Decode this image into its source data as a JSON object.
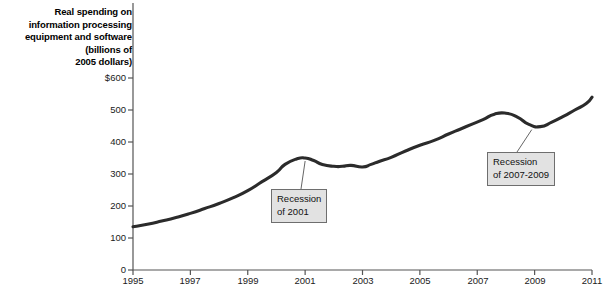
{
  "chart_data": {
    "type": "line",
    "title": "Real spending on information processing equipment and software (billions of 2005 dollars)",
    "title_lines": [
      "Real spending on",
      "information processing",
      "equipment and software",
      "(billions of",
      "2005 dollars)"
    ],
    "xlabel": "",
    "ylabel": "",
    "xlim": [
      1995,
      2011
    ],
    "ylim": [
      0,
      600
    ],
    "grid": false,
    "legend": null,
    "line_color": "#2b2b2b",
    "ytick_labels": [
      "$600",
      "500",
      "400",
      "300",
      "200",
      "100",
      "0"
    ],
    "ytick_values": [
      600,
      500,
      400,
      300,
      200,
      100,
      0
    ],
    "xtick_labels": [
      "1995",
      "1997",
      "1999",
      "2001",
      "2003",
      "2005",
      "2007",
      "2009",
      "2011"
    ],
    "xtick_values": [
      1995,
      1997,
      1999,
      2001,
      2003,
      2005,
      2007,
      2009,
      2011
    ],
    "x": [
      1995.0,
      1995.5,
      1996.0,
      1996.5,
      1997.0,
      1997.5,
      1998.0,
      1998.5,
      1999.0,
      1999.5,
      2000.0,
      2000.3,
      2000.7,
      2001.0,
      2001.3,
      2001.6,
      2002.0,
      2002.3,
      2002.6,
      2003.0,
      2003.3,
      2003.6,
      2004.0,
      2004.5,
      2005.0,
      2005.5,
      2006.0,
      2006.4,
      2006.8,
      2007.2,
      2007.6,
      2008.0,
      2008.4,
      2008.8,
      2009.2,
      2009.6,
      2010.0,
      2010.4,
      2010.8,
      2011.0
    ],
    "y": [
      135,
      143,
      153,
      164,
      177,
      192,
      208,
      226,
      248,
      276,
      305,
      330,
      347,
      350,
      342,
      330,
      324,
      324,
      327,
      322,
      330,
      340,
      352,
      372,
      390,
      405,
      425,
      440,
      455,
      470,
      487,
      490,
      478,
      455,
      448,
      462,
      480,
      500,
      520,
      540
    ],
    "annotations": [
      {
        "id": "recession-2001",
        "lines": [
          "Recession",
          "of 2001"
        ],
        "point_x": 2001.0,
        "point_y": 350
      },
      {
        "id": "recession-2007-2009",
        "lines": [
          "Recession",
          "of 2007-2009"
        ],
        "point_x": 2008.9,
        "point_y": 448
      }
    ]
  },
  "axis_title_lines": [
    "Real spending on",
    "information processing",
    "equipment and software",
    "(billions of",
    "2005 dollars)"
  ],
  "yticks": [
    {
      "label": "$600",
      "top": 72
    },
    {
      "label": "500",
      "top": 104
    },
    {
      "label": "400",
      "top": 136
    },
    {
      "label": "300",
      "top": 168
    },
    {
      "label": "200",
      "top": 200
    },
    {
      "label": "100",
      "top": 232
    },
    {
      "label": "0",
      "top": 264
    }
  ],
  "xticks": [
    {
      "label": "1995",
      "left": 113
    },
    {
      "label": "1997",
      "left": 170
    },
    {
      "label": "1999",
      "left": 228
    },
    {
      "label": "2001",
      "left": 285
    },
    {
      "label": "2003",
      "left": 343
    },
    {
      "label": "2005",
      "left": 400
    },
    {
      "label": "2007",
      "left": 458
    },
    {
      "label": "2009",
      "left": 515
    },
    {
      "label": "2011",
      "left": 572
    }
  ],
  "callouts": [
    {
      "id": "recession-2001",
      "left": 271,
      "top": 189,
      "lines": [
        "Recession",
        "of 2001"
      ]
    },
    {
      "id": "recession-2007-2009",
      "left": 487,
      "top": 152,
      "lines": [
        "Recession",
        "of 2007-2009"
      ]
    }
  ]
}
